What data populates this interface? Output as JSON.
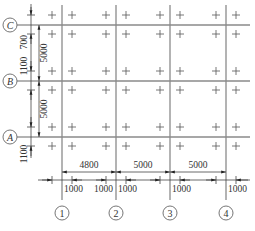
{
  "diagram": {
    "colors": {
      "grid_line": "#8a8a8a",
      "dimension_line": "#444444",
      "text": "#333333"
    },
    "vertical_axes": [
      {
        "label": "1",
        "x": 62
      },
      {
        "label": "2",
        "x": 116
      },
      {
        "label": "3",
        "x": 170
      },
      {
        "label": "4",
        "x": 226
      }
    ],
    "horizontal_axes": [
      {
        "label": "C",
        "y": 25
      },
      {
        "label": "B",
        "y": 81
      },
      {
        "label": "A",
        "y": 137
      }
    ],
    "bottom_dimensions": {
      "spans": [
        "4800",
        "5000",
        "5000"
      ],
      "offsets": [
        "1000",
        "1000",
        "1000",
        "1000",
        "1000"
      ]
    },
    "left_dimensions": {
      "spans": [
        "5000",
        "5000"
      ],
      "offsets": [
        "700",
        "1100",
        "1100"
      ]
    },
    "column_marks": {
      "symbol": "+",
      "rows_y": [
        15,
        34,
        71,
        90,
        127,
        146
      ],
      "cols_x": [
        52,
        72,
        106,
        126,
        160,
        180,
        216,
        236
      ]
    }
  }
}
